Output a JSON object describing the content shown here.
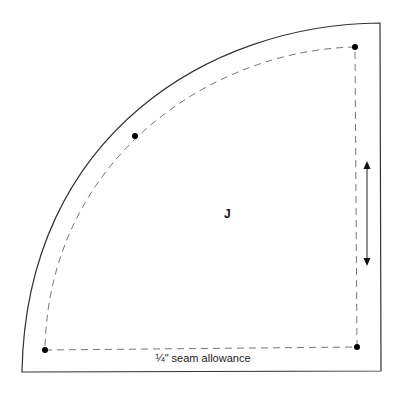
{
  "diagram": {
    "type": "quilting-template",
    "piece_label": "J",
    "caption": "¼\" seam allowance",
    "colors": {
      "outline": "#333333",
      "seam_line": "#777777",
      "dot": "#000000",
      "background": "#ffffff"
    },
    "outer_shape": {
      "corner_top_right": [
        380,
        23
      ],
      "corner_bottom_right": [
        381,
        371
      ],
      "corner_bottom_left": [
        22,
        372
      ],
      "arc": "quarter-circle from bottom-left to top-right"
    },
    "seam_line": {
      "style": "dashed",
      "corners": [
        [
          355,
          47
        ],
        [
          357,
          347
        ],
        [
          45,
          350
        ]
      ]
    },
    "dots": [
      {
        "name": "top-right",
        "x": 355,
        "y": 47
      },
      {
        "name": "arc-mid",
        "x": 135,
        "y": 136
      },
      {
        "name": "bottom-right",
        "x": 357,
        "y": 347
      },
      {
        "name": "bottom-left",
        "x": 45,
        "y": 350
      }
    ],
    "grain_arrow": {
      "x": 367,
      "y1": 162,
      "y2": 265,
      "direction": "vertical double-headed"
    }
  }
}
